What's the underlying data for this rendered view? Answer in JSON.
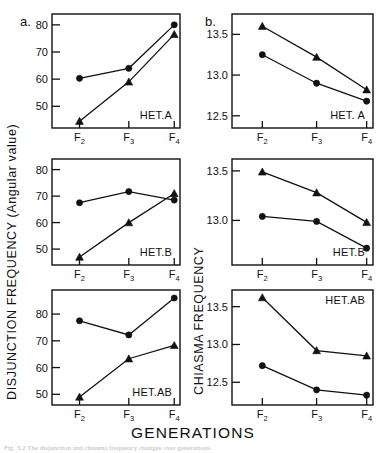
{
  "figure": {
    "panel_letters": {
      "left": "a.",
      "right": "b."
    },
    "left_axis_title": "DISJUNCTION FREQUENCY (Angular value)",
    "right_axis_title": "CHIASMA FREQUENCY",
    "x_axis_title": "GENERATIONS",
    "x_categories": [
      "F",
      "F",
      "F"
    ],
    "x_subscripts": [
      "2",
      "3",
      "4"
    ],
    "x_tick_labels_full": [
      "F2",
      "F3",
      "F4"
    ],
    "caption": "Fig. 3.2  The disjunction and chiasma frequency changes over generations."
  },
  "chart_data": [
    {
      "type": "line",
      "panel": "a",
      "row": 1,
      "title": "HET.A",
      "xlabel": "GENERATIONS",
      "ylabel": "DISJUNCTION FREQUENCY (Angular value)",
      "x": [
        "F2",
        "F3",
        "F4"
      ],
      "ylim": [
        42,
        84
      ],
      "yticks": [
        50,
        60,
        70,
        80
      ],
      "ytick_labels": [
        "50",
        "60",
        "70",
        "80"
      ],
      "grid": false,
      "legend": "none",
      "series": [
        {
          "name": "circle",
          "marker": "circle",
          "values": [
            60.3,
            64.0,
            80.0
          ]
        },
        {
          "name": "triangle",
          "marker": "triangle",
          "values": [
            44.5,
            59.0,
            76.5
          ]
        }
      ]
    },
    {
      "type": "line",
      "panel": "b",
      "row": 1,
      "title": "HET. A",
      "xlabel": "GENERATIONS",
      "ylabel": "CHIASMA FREQUENCY",
      "x": [
        "F2",
        "F3",
        "F4"
      ],
      "ylim": [
        12.35,
        13.75
      ],
      "yticks": [
        12.5,
        13.0,
        13.5
      ],
      "ytick_labels": [
        "12.5",
        "13.0",
        "13.5"
      ],
      "grid": false,
      "legend": "none",
      "series": [
        {
          "name": "triangle",
          "marker": "triangle",
          "values": [
            13.6,
            13.22,
            12.82
          ]
        },
        {
          "name": "circle",
          "marker": "circle",
          "values": [
            13.25,
            12.9,
            12.68
          ]
        }
      ]
    },
    {
      "type": "line",
      "panel": "a",
      "row": 2,
      "title": "HET.B",
      "xlabel": "GENERATIONS",
      "ylabel": "DISJUNCTION FREQUENCY (Angular value)",
      "x": [
        "F2",
        "F3",
        "F4"
      ],
      "ylim": [
        44,
        84
      ],
      "yticks": [
        50,
        60,
        70,
        80
      ],
      "ytick_labels": [
        "50",
        "60",
        "70",
        "80"
      ],
      "grid": false,
      "legend": "none",
      "series": [
        {
          "name": "circle",
          "marker": "circle",
          "values": [
            67.5,
            71.7,
            68.5
          ]
        },
        {
          "name": "triangle",
          "marker": "triangle",
          "values": [
            47.0,
            60.0,
            71.0
          ]
        }
      ]
    },
    {
      "type": "line",
      "panel": "b",
      "row": 2,
      "title": "HET.B",
      "xlabel": "GENERATIONS",
      "ylabel": "CHIASMA FREQUENCY",
      "x": [
        "F2",
        "F3",
        "F4"
      ],
      "ylim": [
        12.55,
        13.62
      ],
      "yticks": [
        12.5,
        13.0,
        13.5
      ],
      "ytick_labels": [
        "12.5",
        "13.0",
        "13.5"
      ],
      "grid": false,
      "legend": "none",
      "series": [
        {
          "name": "triangle",
          "marker": "triangle",
          "values": [
            13.49,
            13.28,
            12.98
          ]
        },
        {
          "name": "circle",
          "marker": "circle",
          "values": [
            13.04,
            12.99,
            12.72
          ]
        }
      ]
    },
    {
      "type": "line",
      "panel": "a",
      "row": 3,
      "title": "HET.AB",
      "xlabel": "GENERATIONS",
      "ylabel": "DISJUNCTION FREQUENCY (Angular value)",
      "x": [
        "F2",
        "F3",
        "F4"
      ],
      "ylim": [
        46,
        89
      ],
      "yticks": [
        50,
        60,
        70,
        80
      ],
      "ytick_labels": [
        "50",
        "60",
        "70",
        "80"
      ],
      "grid": false,
      "legend": "none",
      "series": [
        {
          "name": "circle",
          "marker": "circle",
          "values": [
            77.5,
            72.2,
            86.0
          ]
        },
        {
          "name": "triangle",
          "marker": "triangle",
          "values": [
            49.0,
            63.3,
            68.3
          ]
        }
      ]
    },
    {
      "type": "line",
      "panel": "b",
      "row": 3,
      "title": "HET.AB",
      "title_position": "top-right",
      "xlabel": "GENERATIONS",
      "ylabel": "CHIASMA FREQUENCY",
      "x": [
        "F2",
        "F3",
        "F4"
      ],
      "ylim": [
        12.2,
        13.72
      ],
      "yticks": [
        12.5,
        13.0,
        13.5
      ],
      "ytick_labels": [
        "12.5",
        "13.0",
        "13.5"
      ],
      "grid": false,
      "legend": "none",
      "series": [
        {
          "name": "triangle",
          "marker": "triangle",
          "values": [
            13.62,
            12.92,
            12.85
          ]
        },
        {
          "name": "circle",
          "marker": "circle",
          "values": [
            12.72,
            12.4,
            12.33
          ]
        }
      ]
    }
  ]
}
